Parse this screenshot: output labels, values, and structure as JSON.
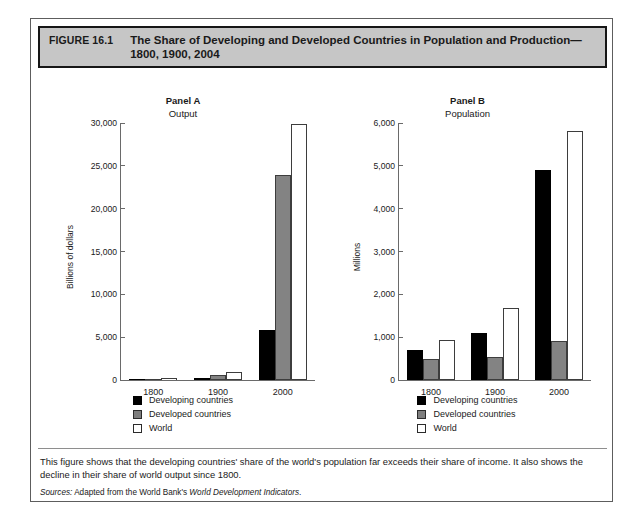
{
  "figure": {
    "number": "FIGURE 16.1",
    "title": "The Share of Developing and Developed Countries in Population and Production—1800, 1900, 2004",
    "caption": "This figure shows that the developing countries' share of the world's population far exceeds their share of income. It also shows the decline in their share of world output since 1800.",
    "sources_label": "Sources:",
    "sources_text_before": "Adapted from the World Bank's",
    "sources_italic": "World Development Indicators",
    "sources_period": "."
  },
  "legend": {
    "items": [
      {
        "label": "Developing countries",
        "color": "#000000",
        "key": "developing"
      },
      {
        "label": "Developed countries",
        "color": "#7e7e7e",
        "key": "developed"
      },
      {
        "label": "World",
        "color": "#ffffff",
        "key": "world"
      }
    ]
  },
  "chart_data": [
    {
      "type": "bar",
      "panel": "Panel A",
      "title": "Panel A",
      "subtitle": "Output",
      "ylabel": "Billions of dollars",
      "xlabel": "",
      "categories": [
        "1800",
        "1900",
        "2000"
      ],
      "series": [
        {
          "name": "Developing countries",
          "values": [
            110,
            210,
            5800
          ],
          "color": "#000000"
        },
        {
          "name": "Developed countries",
          "values": [
            90,
            600,
            23800
          ],
          "color": "#7e7e7e"
        },
        {
          "name": "World",
          "values": [
            200,
            900,
            29800
          ],
          "color": "#ffffff"
        }
      ],
      "ylim": [
        0,
        30000
      ],
      "yticks": [
        "0",
        "5,000",
        "10,000",
        "15,000",
        "20,000",
        "25,000",
        "30,000"
      ],
      "ytick_values": [
        0,
        5000,
        10000,
        15000,
        20000,
        25000,
        30000
      ],
      "grid": false,
      "legend_position": "bottom"
    },
    {
      "type": "bar",
      "panel": "Panel B",
      "title": "Panel B",
      "subtitle": "Population",
      "ylabel": "Millions",
      "xlabel": "",
      "categories": [
        "1800",
        "1900",
        "2000"
      ],
      "series": [
        {
          "name": "Developing countries",
          "values": [
            690,
            1100,
            4890
          ],
          "color": "#000000"
        },
        {
          "name": "Developed countries",
          "values": [
            480,
            540,
            910
          ],
          "color": "#7e7e7e"
        },
        {
          "name": "World",
          "values": [
            940,
            1680,
            5800
          ],
          "color": "#ffffff"
        }
      ],
      "ylim": [
        0,
        6000
      ],
      "yticks": [
        "0",
        "1,000",
        "2,000",
        "3,000",
        "4,000",
        "5,000",
        "6,000"
      ],
      "ytick_values": [
        0,
        1000,
        2000,
        3000,
        4000,
        5000,
        6000
      ],
      "grid": false,
      "legend_position": "bottom"
    }
  ]
}
